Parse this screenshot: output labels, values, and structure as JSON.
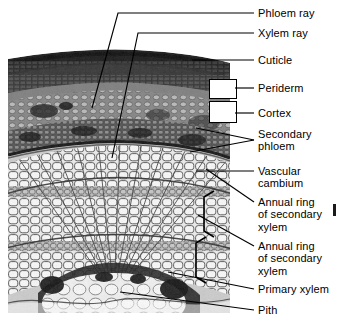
{
  "figure": {
    "type": "light-micrograph-cross-section",
    "image_region": {
      "x": 8,
      "y": 45,
      "width": 222,
      "height": 268
    },
    "colors": {
      "ink": "#000000",
      "background": "#ffffff",
      "micrograph_light": "#f2f2f2",
      "micrograph_mid": "#9a9a9a",
      "micrograph_dark": "#2a2a2a"
    }
  },
  "labels": [
    {
      "id": "phloem-ray",
      "text": "Phloem ray",
      "x": 258,
      "y": 9,
      "lines": 1
    },
    {
      "id": "xylem-ray",
      "text": "Xylem ray",
      "x": 258,
      "y": 29,
      "lines": 1
    },
    {
      "id": "cuticle",
      "text": "Cuticle",
      "x": 258,
      "y": 56,
      "lines": 1
    },
    {
      "id": "periderm",
      "text": "Periderm",
      "x": 258,
      "y": 84,
      "lines": 1
    },
    {
      "id": "cortex",
      "text": "Cortex",
      "x": 258,
      "y": 109,
      "lines": 1
    },
    {
      "id": "secondary-phloem",
      "text": "Secondary\nphloem",
      "x": 258,
      "y": 135,
      "lines": 2
    },
    {
      "id": "vascular-cambium",
      "text": "Vascular\ncambium",
      "x": 258,
      "y": 166,
      "lines": 2
    },
    {
      "id": "annual-ring-1",
      "text": "Annual ring\nof secondary\nxylem",
      "x": 258,
      "y": 197,
      "lines": 3
    },
    {
      "id": "annual-ring-2",
      "text": "Annual ring\nof secondary\nxylem",
      "x": 258,
      "y": 241,
      "lines": 3
    },
    {
      "id": "primary-xylem",
      "text": "Primary xylem",
      "x": 258,
      "y": 285,
      "lines": 1
    },
    {
      "id": "pith",
      "text": "Pith",
      "x": 258,
      "y": 306,
      "lines": 1
    }
  ],
  "brackets": [
    {
      "id": "periderm-bracket",
      "x": 209,
      "y": 79,
      "width": 26,
      "height": 18
    },
    {
      "id": "cortex-bracket",
      "x": 209,
      "y": 101,
      "width": 26,
      "height": 20
    }
  ],
  "annotations": {
    "annual_ring_bracket_1": "square bracket spanning outer annual ring of secondary xylem",
    "annual_ring_bracket_2": "square bracket spanning inner annual ring of secondary xylem",
    "secondary_phloem_leader": "two leader lines converging to a single point"
  }
}
